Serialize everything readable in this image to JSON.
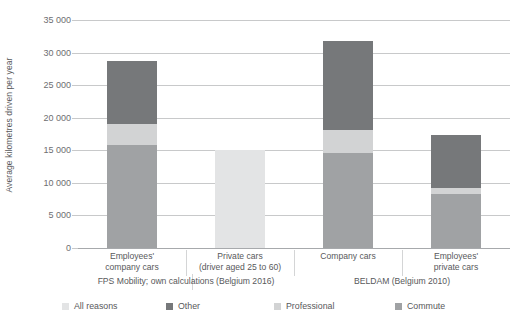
{
  "chart_data": {
    "type": "bar",
    "subtype": "stacked-vertical",
    "title": "",
    "xlabel": "",
    "ylabel": "Average kilometres driven per year",
    "ylim": [
      0,
      35000
    ],
    "ytick_labels": [
      "0",
      "5 000",
      "10 000",
      "15 000",
      "20 000",
      "25 000",
      "30 000",
      "35 000"
    ],
    "ytick_values": [
      0,
      5000,
      10000,
      15000,
      20000,
      25000,
      30000,
      35000
    ],
    "grid": true,
    "legend_position": "bottom",
    "categories": [
      "Employees' company cars",
      "Private cars (driver aged 25 to 60)",
      "Company cars",
      "Employees' private cars"
    ],
    "category_lines": [
      [
        "Employees'",
        "company cars"
      ],
      [
        "Private cars",
        "(driver aged 25 to 60)"
      ],
      [
        "Company cars",
        ""
      ],
      [
        "Employees'",
        "private cars"
      ]
    ],
    "groups": [
      {
        "label": "FPS Mobility; own calculations (Belgium 2016)",
        "categories": [
          0,
          1
        ]
      },
      {
        "label": "BELDAM (Belgium 2010)",
        "categories": [
          2,
          3
        ]
      }
    ],
    "series": [
      {
        "name": "All reasons",
        "color": "#e3e4e5",
        "values": [
          0,
          15100,
          0,
          0
        ]
      },
      {
        "name": "Commute",
        "color": "#a0a2a4",
        "values": [
          15800,
          0,
          14600,
          8300
        ]
      },
      {
        "name": "Professional",
        "color": "#d2d3d4",
        "values": [
          3200,
          0,
          3500,
          900
        ]
      },
      {
        "name": "Other",
        "color": "#76787a",
        "values": [
          9750,
          0,
          13650,
          8100
        ]
      }
    ],
    "stack_order": [
      "Commute",
      "Professional",
      "Other"
    ],
    "totals": [
      28750,
      15100,
      31750,
      17300
    ]
  },
  "legend": {
    "items": [
      {
        "label": "All reasons",
        "color": "#e3e4e5"
      },
      {
        "label": "Other",
        "color": "#76787a"
      },
      {
        "label": "Professional",
        "color": "#d2d3d4"
      },
      {
        "label": "Commute",
        "color": "#a0a2a4"
      }
    ]
  },
  "colors": {
    "all_reasons": "#e3e4e5",
    "other": "#76787a",
    "professional": "#d2d3d4",
    "commute": "#a0a2a4",
    "gridline": "#c8c9ca",
    "text": "#58595b",
    "tick_text": "#6d6e71",
    "background": "#ffffff"
  }
}
